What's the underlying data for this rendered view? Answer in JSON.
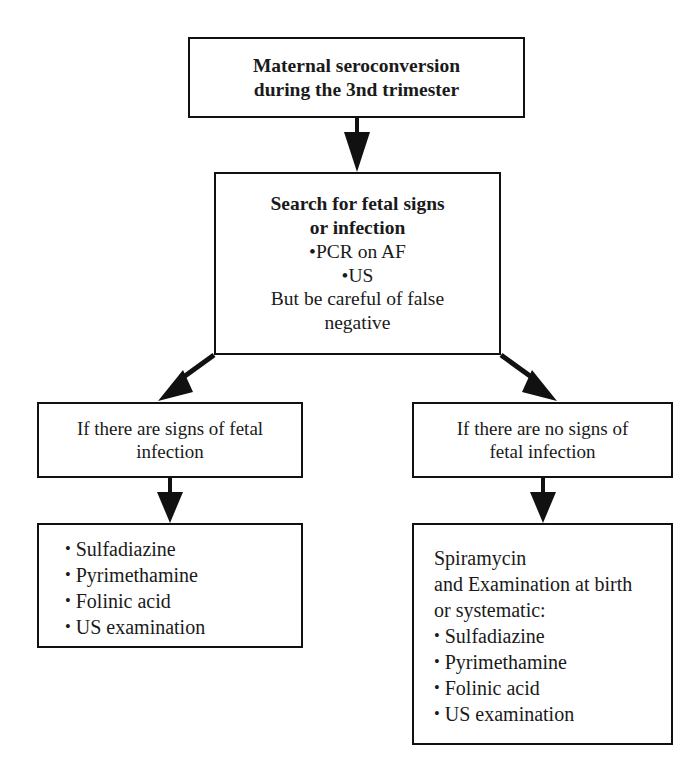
{
  "diagram": {
    "type": "flowchart",
    "background_color": "#ffffff",
    "line_color": "#111111",
    "text_color": "#1a1a1a"
  },
  "nodes": {
    "top": {
      "id": "maternal-seroconversion",
      "lines": [
        "Maternal seroconversion",
        "during the 3nd trimester"
      ]
    },
    "search": {
      "id": "search-fetal-signs",
      "heading_lines": [
        "Search for fetal signs",
        "or infection"
      ],
      "bullets": [
        "PCR on AF",
        "US"
      ],
      "footer_lines": [
        "But be careful of false",
        "negative"
      ]
    },
    "branch_positive": {
      "id": "signs-of-fetal-infection",
      "lines": [
        "If there are signs of fetal",
        "infection"
      ]
    },
    "branch_negative": {
      "id": "no-signs-of-fetal-infection",
      "lines": [
        "If there are no signs of",
        "fetal infection"
      ]
    },
    "treatment_positive": {
      "id": "treatment-if-signs",
      "bullets": [
        "Sulfadiazine",
        "Pyrimethamine",
        "Folinic acid",
        "US examination"
      ]
    },
    "treatment_negative": {
      "id": "treatment-if-no-signs",
      "lines": [
        "Spiramycin",
        "and Examination at birth",
        "or systematic:"
      ],
      "bullets": [
        "Sulfadiazine",
        "Pyrimethamine",
        "Folinic acid",
        "US examination"
      ]
    }
  },
  "connectors": {
    "top_to_search": "arrow-down",
    "search_to_positive": "arrow-down-left",
    "search_to_negative": "arrow-down-right",
    "positive_to_treatment": "arrow-down",
    "negative_to_treatment": "arrow-down"
  },
  "glyphs": {
    "bullet": "•"
  }
}
